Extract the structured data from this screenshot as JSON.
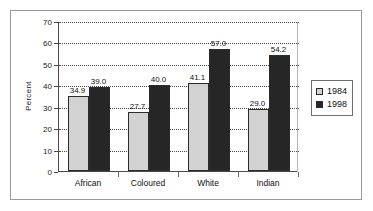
{
  "chart_data": {
    "type": "bar",
    "title": "",
    "subtitle": "",
    "xlabel": "",
    "ylabel": "Percent",
    "ylim": [
      0,
      70
    ],
    "ytick_step": 10,
    "yticks": [
      "0",
      "10",
      "20",
      "30",
      "40",
      "50",
      "60",
      "70"
    ],
    "grid": true,
    "grid_style": "dotted-horizontal",
    "legend_position": "right",
    "categories": [
      "African",
      "Coloured",
      "White",
      "Indian"
    ],
    "series": [
      {
        "name": "1984",
        "color": "#d2d2d2",
        "values": [
          34.9,
          27.7,
          41.1,
          29.0
        ],
        "labels": [
          "34.9",
          "27.7",
          "41.1",
          "29.0"
        ]
      },
      {
        "name": "1998",
        "color": "#262626",
        "values": [
          39.0,
          40.0,
          57.0,
          54.2
        ],
        "labels": [
          "39.0",
          "40.0",
          "57.0",
          "54.2"
        ]
      }
    ]
  },
  "legend": {
    "entries": [
      {
        "label": "1984"
      },
      {
        "label": "1998"
      }
    ]
  },
  "colors": {
    "series_1984": "#d2d2d2",
    "series_1998": "#262626",
    "axis": "#4a4a4a",
    "grid": "#4d4d4d",
    "frame": "#9a9a9a",
    "text": "#111111"
  }
}
